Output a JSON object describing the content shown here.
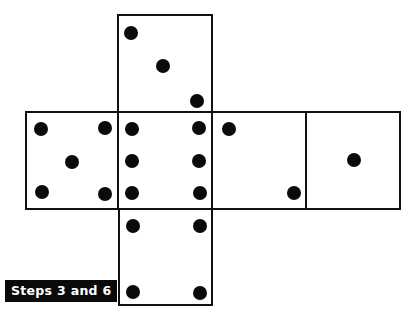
{
  "caption": "Steps 3 and 6",
  "diagram": {
    "type": "cube-net",
    "faces": [
      {
        "id": "top",
        "pips": 3
      },
      {
        "id": "left",
        "pips": 5
      },
      {
        "id": "center",
        "pips": 6
      },
      {
        "id": "right",
        "pips": 2
      },
      {
        "id": "far-right",
        "pips": 1
      },
      {
        "id": "bottom",
        "pips": 4
      }
    ]
  }
}
